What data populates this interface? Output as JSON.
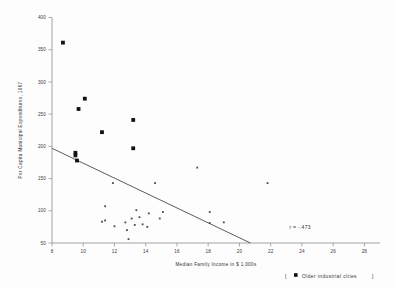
{
  "chart_data": {
    "type": "scatter",
    "title": "",
    "xlabel": "Median Family Income in $ 1,000s",
    "ylabel": "Per Capita Municipal Expenditures, 1967",
    "xlim": [
      8,
      29
    ],
    "ylim": [
      50,
      400
    ],
    "xticks": [
      8,
      10,
      12,
      14,
      16,
      18,
      20,
      22,
      24,
      26,
      28
    ],
    "yticks": [
      50,
      100,
      150,
      200,
      250,
      300,
      350,
      400
    ],
    "grid": false,
    "legend_position": "bottom-right",
    "legend": [
      {
        "label": "Older industrial cities",
        "marker": "filled-square",
        "size": "large"
      }
    ],
    "annotations": [
      {
        "text": "r = -.473",
        "x": 23.2,
        "y": 72
      }
    ],
    "trendline": {
      "type": "linear",
      "x_start": 8.0,
      "y_start": 197,
      "x_end": 20.7,
      "y_end": 50,
      "correlation": -0.473
    },
    "series": [
      {
        "name": "Older industrial cities",
        "marker": "filled-square",
        "color": "#111111",
        "points": [
          {
            "x": 8.7,
            "y": 361
          },
          {
            "x": 9.7,
            "y": 258
          },
          {
            "x": 10.1,
            "y": 274
          },
          {
            "x": 11.2,
            "y": 222
          },
          {
            "x": 13.2,
            "y": 241
          },
          {
            "x": 13.2,
            "y": 197
          },
          {
            "x": 9.5,
            "y": 190
          },
          {
            "x": 9.5,
            "y": 186
          },
          {
            "x": 9.6,
            "y": 178
          }
        ]
      },
      {
        "name": "Other cities",
        "marker": "small-dot",
        "color": "#4a4a4a",
        "points": [
          {
            "x": 11.9,
            "y": 143
          },
          {
            "x": 14.6,
            "y": 143
          },
          {
            "x": 17.3,
            "y": 167
          },
          {
            "x": 21.8,
            "y": 143
          },
          {
            "x": 11.4,
            "y": 107
          },
          {
            "x": 13.4,
            "y": 101
          },
          {
            "x": 15.1,
            "y": 98
          },
          {
            "x": 14.2,
            "y": 96
          },
          {
            "x": 18.1,
            "y": 98
          },
          {
            "x": 11.2,
            "y": 83
          },
          {
            "x": 11.4,
            "y": 85
          },
          {
            "x": 12.0,
            "y": 76
          },
          {
            "x": 12.7,
            "y": 82
          },
          {
            "x": 13.1,
            "y": 88
          },
          {
            "x": 13.6,
            "y": 90
          },
          {
            "x": 13.3,
            "y": 78
          },
          {
            "x": 13.8,
            "y": 79
          },
          {
            "x": 14.1,
            "y": 75
          },
          {
            "x": 14.9,
            "y": 88
          },
          {
            "x": 12.8,
            "y": 70
          },
          {
            "x": 12.9,
            "y": 56
          },
          {
            "x": 18.1,
            "y": 81
          },
          {
            "x": 19.0,
            "y": 82
          }
        ]
      }
    ]
  },
  "legend": {
    "bracket_open": "[",
    "bracket_close": "]",
    "entry_label": "Older industrial cities"
  },
  "axes": {
    "x_title": "Median Family Income in $ 1,000s",
    "y_title": "Per Capita Municipal Expenditures, 1967"
  }
}
